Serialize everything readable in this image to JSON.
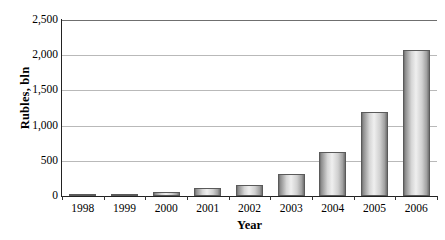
{
  "chart_data": {
    "type": "bar",
    "title": "",
    "subtitle": "",
    "xlabel": "Year",
    "ylabel": "Rubles, bln",
    "categories": [
      "1998",
      "1999",
      "2000",
      "2001",
      "2002",
      "2003",
      "2004",
      "2005",
      "2006"
    ],
    "values": [
      25,
      35,
      50,
      110,
      155,
      310,
      630,
      1190,
      2070
    ],
    "series": [
      {
        "name": "Rubles, bln",
        "values": [
          25,
          35,
          50,
          110,
          155,
          310,
          630,
          1190,
          2070
        ]
      }
    ],
    "ylim": [
      0,
      2500
    ],
    "y_ticks": [
      0,
      500,
      1000,
      1500,
      2000,
      2500
    ],
    "y_tick_labels": [
      "0",
      "500",
      "1,000",
      "1,500",
      "2,000",
      "2,500"
    ],
    "grid": true,
    "grid_axis": "y",
    "legend": false,
    "legend_position": "none",
    "bar_color": "#cfcfcf",
    "bar_edge_color": "#5a5a5a",
    "grid_color": "#b9b9b9",
    "axis_color": "#222222",
    "background_color": "#ffffff",
    "text_color": "#000000"
  }
}
